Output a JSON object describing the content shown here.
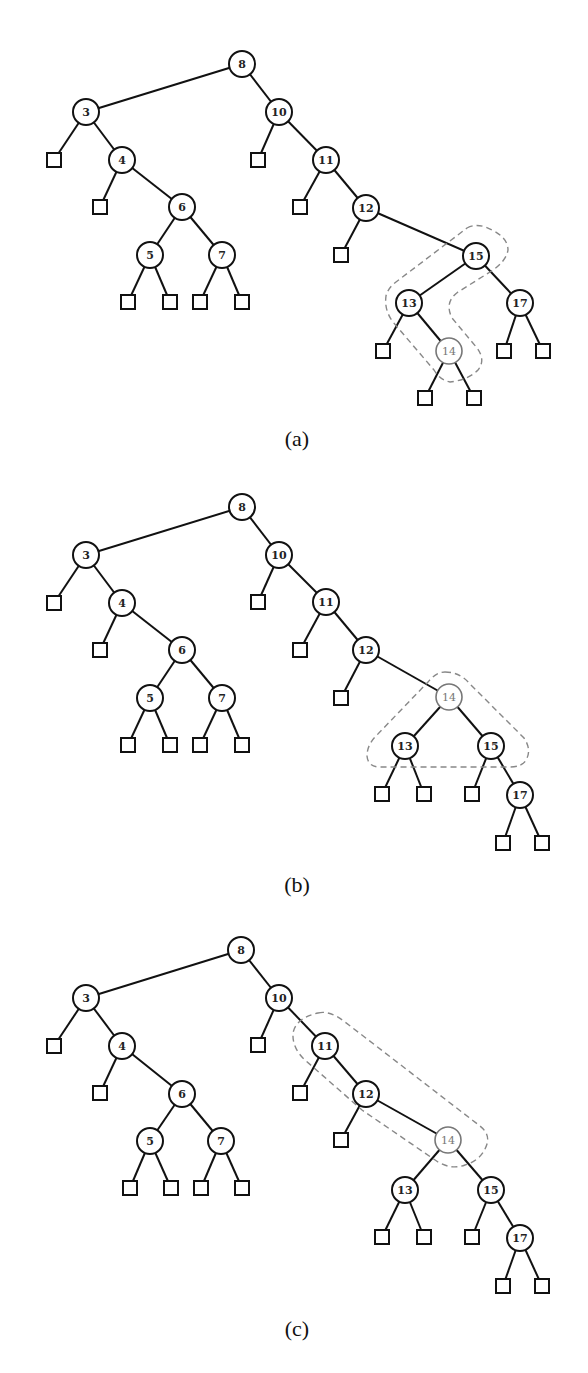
{
  "figure": {
    "panels": [
      {
        "id": "a",
        "caption": "(a)",
        "caption_pos": [
          297,
          438
        ],
        "highlight": "14",
        "loop_path": "M 467 228 Q 478 222 492 230 Q 508 238 508 250 Q 506 262 490 272 L 458 292 Q 444 302 452 318 L 477 348 Q 486 360 478 370 Q 468 380 450 382 Q 440 380 434 370 L 393 322 Q 384 310 386 296 Q 388 288 396 282 Z",
        "nodes": [
          {
            "key": "8",
            "x": 242,
            "y": 64
          },
          {
            "key": "3",
            "x": 86,
            "y": 112
          },
          {
            "key": "10",
            "x": 279,
            "y": 112
          },
          {
            "key": "4",
            "x": 122,
            "y": 160
          },
          {
            "key": "11",
            "x": 326,
            "y": 160
          },
          {
            "key": "6",
            "x": 182,
            "y": 207
          },
          {
            "key": "12",
            "x": 366,
            "y": 208
          },
          {
            "key": "5",
            "x": 150,
            "y": 255
          },
          {
            "key": "7",
            "x": 222,
            "y": 255
          },
          {
            "key": "15",
            "x": 476,
            "y": 256
          },
          {
            "key": "13",
            "x": 409,
            "y": 303
          },
          {
            "key": "17",
            "x": 520,
            "y": 303
          },
          {
            "key": "14",
            "x": 449,
            "y": 351
          }
        ],
        "edges": [
          [
            "8",
            "3"
          ],
          [
            "8",
            "10"
          ],
          [
            "3",
            "4"
          ],
          [
            "4",
            "6"
          ],
          [
            "6",
            "5"
          ],
          [
            "6",
            "7"
          ],
          [
            "10",
            "11"
          ],
          [
            "11",
            "12"
          ],
          [
            "12",
            "15"
          ],
          [
            "15",
            "13"
          ],
          [
            "15",
            "17"
          ],
          [
            "13",
            "14"
          ]
        ],
        "leaves": [
          {
            "parent": "3",
            "x": 54,
            "y": 160
          },
          {
            "parent": "4",
            "x": 100,
            "y": 207
          },
          {
            "parent": "5",
            "x": 128,
            "y": 302
          },
          {
            "parent": "5",
            "x": 170,
            "y": 302
          },
          {
            "parent": "7",
            "x": 200,
            "y": 302
          },
          {
            "parent": "7",
            "x": 242,
            "y": 302
          },
          {
            "parent": "10",
            "x": 258,
            "y": 160
          },
          {
            "parent": "11",
            "x": 300,
            "y": 207
          },
          {
            "parent": "12",
            "x": 341,
            "y": 255
          },
          {
            "parent": "13",
            "x": 383,
            "y": 351
          },
          {
            "parent": "14",
            "x": 425,
            "y": 398
          },
          {
            "parent": "14",
            "x": 474,
            "y": 398
          },
          {
            "parent": "17",
            "x": 504,
            "y": 351
          },
          {
            "parent": "17",
            "x": 543,
            "y": 351
          }
        ]
      },
      {
        "id": "b",
        "caption": "(b)",
        "caption_pos": [
          297,
          884
        ],
        "highlight": "14",
        "loop_path": "M 445 672 Q 460 672 470 684 L 524 738 Q 532 750 526 760 Q 522 767 510 767 L 380 767 Q 368 767 367 756 Q 367 745 376 736 L 428 682 Q 436 672 445 672 Z",
        "nodes": [
          {
            "key": "8",
            "x": 242,
            "y": 507
          },
          {
            "key": "3",
            "x": 86,
            "y": 555
          },
          {
            "key": "10",
            "x": 279,
            "y": 555
          },
          {
            "key": "4",
            "x": 122,
            "y": 603
          },
          {
            "key": "11",
            "x": 326,
            "y": 602
          },
          {
            "key": "6",
            "x": 182,
            "y": 650
          },
          {
            "key": "12",
            "x": 366,
            "y": 650
          },
          {
            "key": "5",
            "x": 150,
            "y": 698
          },
          {
            "key": "7",
            "x": 222,
            "y": 698
          },
          {
            "key": "14",
            "x": 449,
            "y": 697
          },
          {
            "key": "13",
            "x": 405,
            "y": 746
          },
          {
            "key": "15",
            "x": 491,
            "y": 746
          },
          {
            "key": "17",
            "x": 520,
            "y": 795
          }
        ],
        "edges": [
          [
            "8",
            "3"
          ],
          [
            "8",
            "10"
          ],
          [
            "3",
            "4"
          ],
          [
            "4",
            "6"
          ],
          [
            "6",
            "5"
          ],
          [
            "6",
            "7"
          ],
          [
            "10",
            "11"
          ],
          [
            "11",
            "12"
          ],
          [
            "12",
            "14"
          ],
          [
            "14",
            "13"
          ],
          [
            "14",
            "15"
          ],
          [
            "15",
            "17"
          ]
        ],
        "leaves": [
          {
            "parent": "3",
            "x": 54,
            "y": 603
          },
          {
            "parent": "4",
            "x": 100,
            "y": 650
          },
          {
            "parent": "5",
            "x": 128,
            "y": 745
          },
          {
            "parent": "5",
            "x": 170,
            "y": 745
          },
          {
            "parent": "7",
            "x": 200,
            "y": 745
          },
          {
            "parent": "7",
            "x": 242,
            "y": 745
          },
          {
            "parent": "10",
            "x": 258,
            "y": 602
          },
          {
            "parent": "11",
            "x": 300,
            "y": 650
          },
          {
            "parent": "12",
            "x": 341,
            "y": 698
          },
          {
            "parent": "13",
            "x": 382,
            "y": 794
          },
          {
            "parent": "13",
            "x": 424,
            "y": 794
          },
          {
            "parent": "15",
            "x": 472,
            "y": 794
          },
          {
            "parent": "17",
            "x": 503,
            "y": 843
          },
          {
            "parent": "17",
            "x": 542,
            "y": 843
          }
        ]
      },
      {
        "id": "c",
        "caption": "(c)",
        "caption_pos": [
          297,
          1328
        ],
        "highlight": "14",
        "loop_path": "M 318 1013 Q 330 1010 345 1022 L 480 1126 Q 490 1134 487 1144 Q 482 1160 465 1165 Q 452 1170 438 1162 L 362 1110 L 305 1060 Q 292 1048 293 1033 Q 296 1018 318 1013 Z",
        "nodes": [
          {
            "key": "8",
            "x": 241,
            "y": 950
          },
          {
            "key": "3",
            "x": 86,
            "y": 998
          },
          {
            "key": "10",
            "x": 279,
            "y": 998
          },
          {
            "key": "4",
            "x": 122,
            "y": 1046
          },
          {
            "key": "11",
            "x": 325,
            "y": 1046
          },
          {
            "key": "6",
            "x": 182,
            "y": 1094
          },
          {
            "key": "12",
            "x": 366,
            "y": 1094
          },
          {
            "key": "5",
            "x": 150,
            "y": 1141
          },
          {
            "key": "7",
            "x": 221,
            "y": 1141
          },
          {
            "key": "14",
            "x": 448,
            "y": 1140
          },
          {
            "key": "13",
            "x": 405,
            "y": 1190
          },
          {
            "key": "15",
            "x": 491,
            "y": 1190
          },
          {
            "key": "17",
            "x": 520,
            "y": 1238
          }
        ],
        "edges": [
          [
            "8",
            "3"
          ],
          [
            "8",
            "10"
          ],
          [
            "3",
            "4"
          ],
          [
            "4",
            "6"
          ],
          [
            "6",
            "5"
          ],
          [
            "6",
            "7"
          ],
          [
            "10",
            "11"
          ],
          [
            "11",
            "12"
          ],
          [
            "12",
            "14"
          ],
          [
            "14",
            "13"
          ],
          [
            "14",
            "15"
          ],
          [
            "15",
            "17"
          ]
        ],
        "leaves": [
          {
            "parent": "3",
            "x": 54,
            "y": 1046
          },
          {
            "parent": "4",
            "x": 100,
            "y": 1093
          },
          {
            "parent": "5",
            "x": 130,
            "y": 1188
          },
          {
            "parent": "5",
            "x": 171,
            "y": 1188
          },
          {
            "parent": "7",
            "x": 201,
            "y": 1188
          },
          {
            "parent": "7",
            "x": 242,
            "y": 1188
          },
          {
            "parent": "10",
            "x": 258,
            "y": 1045
          },
          {
            "parent": "11",
            "x": 300,
            "y": 1093
          },
          {
            "parent": "12",
            "x": 341,
            "y": 1140
          },
          {
            "parent": "13",
            "x": 382,
            "y": 1237
          },
          {
            "parent": "13",
            "x": 424,
            "y": 1237
          },
          {
            "parent": "15",
            "x": 472,
            "y": 1237
          },
          {
            "parent": "17",
            "x": 503,
            "y": 1286
          },
          {
            "parent": "17",
            "x": 542,
            "y": 1286
          }
        ]
      }
    ],
    "style": {
      "node_radius": 13,
      "leaf_size": 14,
      "highlight_color": "#777777",
      "edge_color": "#111111",
      "loop_color": "#888888"
    }
  }
}
